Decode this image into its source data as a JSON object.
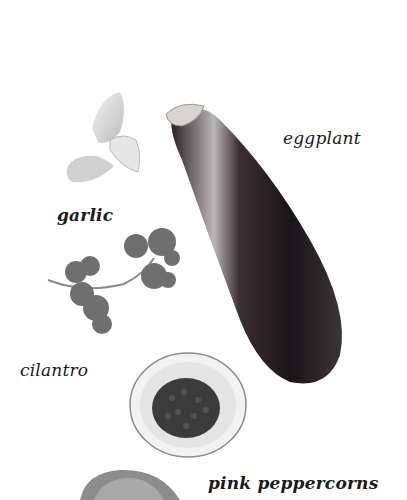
{
  "page": {
    "top_fragment": "",
    "items": [
      {
        "id": "garlic",
        "label": "garlic"
      },
      {
        "id": "eggplant",
        "label": "eggplant"
      },
      {
        "id": "cilantro",
        "label": "cilantro"
      },
      {
        "id": "pink-peppercorns",
        "label": "pink peppercorns"
      }
    ]
  },
  "colors": {
    "background": "#ffffff",
    "text": "#1a1a1a",
    "eggplant_dark": "#1c1418",
    "eggplant_highlight": "#bdb5b7",
    "cilantro": "#6f6f6f",
    "garlic": "#d4d4d4",
    "bowl_rim": "#8a8a8a",
    "peppercorns": "#3b3b3b"
  }
}
